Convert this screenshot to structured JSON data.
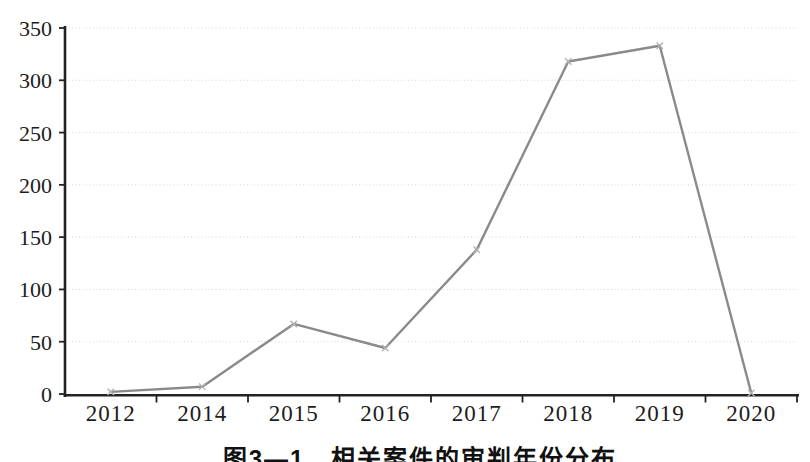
{
  "chart_data": {
    "type": "line",
    "title": "",
    "caption": "图3—1　相关案件的审判年份分布",
    "categories": [
      "2012",
      "2014",
      "2015",
      "2016",
      "2017",
      "2018",
      "2019",
      "2020"
    ],
    "values": [
      2,
      7,
      67,
      44,
      138,
      318,
      333,
      1
    ],
    "ylim": [
      0,
      350
    ],
    "yticks": [
      0,
      50,
      100,
      150,
      200,
      250,
      300,
      350
    ],
    "xlabel": "",
    "ylabel": "",
    "grid": "horizontal-dotted",
    "legend": "none",
    "marker": "x",
    "colors": {
      "line": "#8a8a8a",
      "marker": "#b2b2b2",
      "axis": "#232323",
      "gridline": "#d6d6d6",
      "text": "#1c1c1c",
      "background": "#ffffff"
    }
  }
}
